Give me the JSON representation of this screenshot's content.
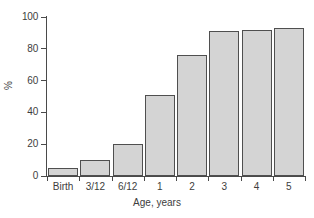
{
  "chart_data": {
    "type": "bar",
    "title": "",
    "subtitle": "",
    "xlabel": "Age, years",
    "ylabel": "%",
    "categories": [
      "Birth",
      "3/12",
      "6/12",
      "1",
      "2",
      "3",
      "4",
      "5"
    ],
    "values": [
      5,
      10,
      20,
      51,
      76,
      91,
      92,
      93
    ],
    "series": [
      {
        "name": "",
        "values": [
          5,
          10,
          20,
          51,
          76,
          91,
          92,
          93
        ]
      }
    ],
    "ylim": [
      0,
      100
    ],
    "yticks": [
      0,
      20,
      40,
      60,
      80,
      100
    ],
    "ytick_labels": [
      "0",
      "20",
      "40",
      "60",
      "80",
      "100"
    ],
    "xtick_labels": [
      "Birth",
      "3/12",
      "6/12",
      "1",
      "2",
      "3",
      "4",
      "5"
    ],
    "grid": false,
    "legend": false,
    "legend_position": "none",
    "annotations": [],
    "colors": {
      "bar_fill": "#d4d4d4",
      "bar_edge": "#4f4f4f",
      "axis": "#4a4a4a",
      "text": "#3d3d3d",
      "background": "#ffffff"
    }
  }
}
